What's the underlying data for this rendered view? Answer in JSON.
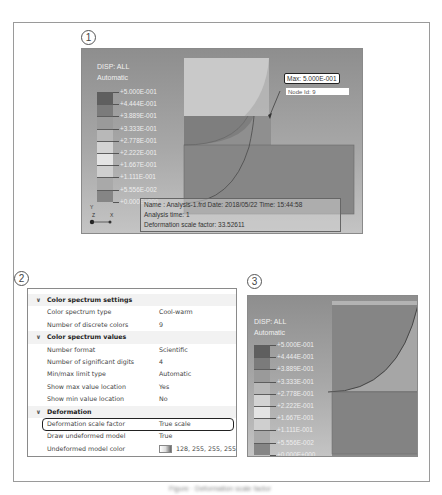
{
  "figure": {
    "panel_labels": [
      "1",
      "2",
      "3"
    ],
    "caption": "Figure · Deformation scale factor"
  },
  "panel1": {
    "title_line1": "DISP: ALL",
    "title_line2": "Automatic",
    "legend": {
      "labels": [
        "+5.000E-001",
        "+4.444E-001",
        "+3.889E-001",
        "+3.333E-001",
        "+2.778E-001",
        "+2.222E-001",
        "+1.667E-001",
        "+1.111E-001",
        "+5.556E-002",
        "+0.000E+000"
      ],
      "colors": [
        "#5f5f5f",
        "#7b7b7b",
        "#9a9a9a",
        "#b8b8b8",
        "#d3d3d3",
        "#e4e4e4",
        "#cfcfcf",
        "#a9a9a9",
        "#858585",
        "#636363"
      ]
    },
    "max_label": "Max: 5.000E-001",
    "node_label": "Node Id: 9",
    "triad": {
      "y": "Y",
      "z": "Z",
      "x": "X"
    },
    "info": {
      "line1": "Name : Analysis-1.frd   Date: 2018/05/22   Time: 15:44:58",
      "line2": "Analysis time: 1",
      "line3": "Deformation scale factor: 33.52611"
    }
  },
  "panel2": {
    "sections": [
      {
        "label": "Color spectrum settings",
        "rows": [
          {
            "key": "Color spectrum type",
            "value": "Cool-warm"
          },
          {
            "key": "Number of discrete colors",
            "value": "9"
          }
        ]
      },
      {
        "label": "Color spectrum values",
        "rows": [
          {
            "key": "Number format",
            "value": "Scientific"
          },
          {
            "key": "Number of significant digits",
            "value": "4"
          },
          {
            "key": "Min/max limit type",
            "value": "Automatic"
          },
          {
            "key": "Show max value location",
            "value": "Yes"
          },
          {
            "key": "Show min value location",
            "value": "No"
          }
        ]
      },
      {
        "label": "Deformation",
        "rows": [
          {
            "key": "Deformation scale factor",
            "value": "True scale",
            "highlighted": true
          },
          {
            "key": "Draw undeformed model",
            "value": "True"
          },
          {
            "key": "Undeformed model color",
            "value": "128, 255, 255, 255",
            "has_color_chip": true
          }
        ]
      }
    ]
  },
  "panel3": {
    "title_line1": "DISP: ALL",
    "title_line2": "Automatic",
    "legend": {
      "labels": [
        "+5.000E-001",
        "+4.444E-001",
        "+3.889E-001",
        "+3.333E-001",
        "+2.778E-001",
        "+2.222E-001",
        "+1.667E-001",
        "+1.111E-001",
        "+5.556E-002",
        "+0.000E+000"
      ]
    }
  }
}
